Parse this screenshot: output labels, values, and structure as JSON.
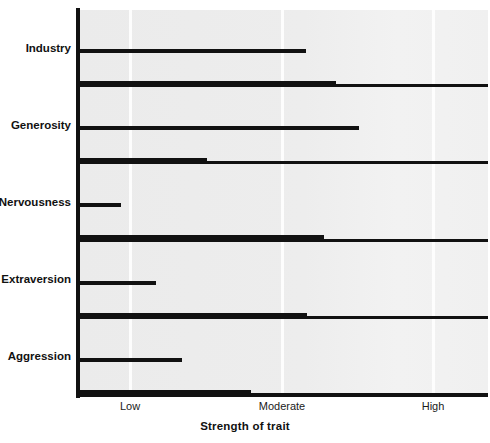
{
  "chart_data": {
    "type": "bar",
    "orientation": "horizontal",
    "title": "",
    "subtitle": "",
    "xlabel": "Strength of trait",
    "ylabel": "",
    "grid": true,
    "legend": null,
    "legend_position": "none",
    "categories": [
      "Industry",
      "Generosity",
      "Nervousness",
      "Extraversion",
      "Aggression"
    ],
    "x_tick_labels": [
      "Low",
      "Moderate",
      "High"
    ],
    "x_tick_values": [
      1,
      2,
      3
    ],
    "xlim": [
      0.66,
      3.36
    ],
    "series": [
      {
        "name": "upper-bar",
        "color": "#6e6e6e",
        "values": [
          2.16,
          2.51,
          0.94,
          1.17,
          1.34
        ]
      },
      {
        "name": "lower-bar",
        "color": "#5a5a5a",
        "values": [
          2.36,
          1.51,
          2.28,
          2.17,
          1.8
        ]
      }
    ],
    "annotations": []
  },
  "axis_title": {
    "text": "Strength of trait"
  },
  "colors": {
    "plot_background": "#ededed",
    "gridline": "#fdfdfd",
    "axis": "#111111",
    "bar_light": "#6e6e6e",
    "bar_dark": "#5a5a5a",
    "bar_shadow": "#111111",
    "text": "#111111"
  }
}
